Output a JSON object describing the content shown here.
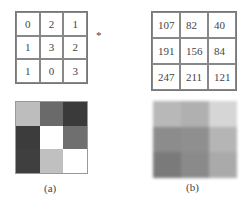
{
  "figure": {
    "matrix_a": {
      "values": [
        [
          0,
          2,
          1
        ],
        [
          1,
          3,
          2
        ],
        [
          1,
          0,
          3
        ]
      ]
    },
    "operator": "*",
    "matrix_b": {
      "values": [
        [
          107,
          82,
          40
        ],
        [
          191,
          156,
          84
        ],
        [
          247,
          211,
          121
        ]
      ]
    },
    "image_a": {
      "colors": [
        [
          "#bdbdbd",
          "#6a6a6a",
          "#3a3a3a"
        ],
        [
          "#3c3c3c",
          "#ffffff",
          "#6f6f6f"
        ],
        [
          "#3f3f3f",
          "#c0c0c0",
          "#ffffff"
        ]
      ]
    },
    "image_b": {
      "colors": [
        [
          "#b8b8b8",
          "#b0b0b0",
          "#d6d6d6"
        ],
        [
          "#8c8c8c",
          "#8f8f8f",
          "#b5b5b5"
        ],
        [
          "#7a7a7a",
          "#8a8a8a",
          "#aaaaaa"
        ]
      ]
    },
    "label_a": "(a)",
    "label_b": "(b)"
  }
}
